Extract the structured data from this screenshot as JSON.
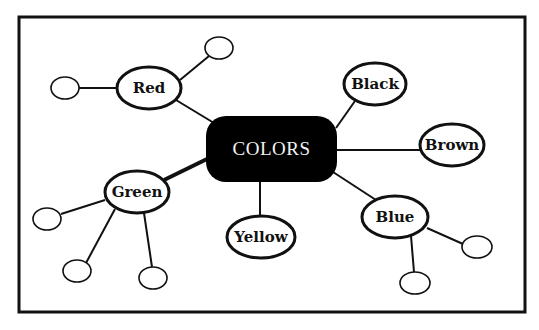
{
  "diagram": {
    "type": "mind-map",
    "center": {
      "label": "COLORS",
      "fill": "#000000",
      "text_color": "#f2f2f2"
    },
    "branches": [
      {
        "label": "Red",
        "empty_children": 2
      },
      {
        "label": "Black",
        "empty_children": 0
      },
      {
        "label": "Brown",
        "empty_children": 0
      },
      {
        "label": "Green",
        "empty_children": 3
      },
      {
        "label": "Yellow",
        "empty_children": 0
      },
      {
        "label": "Blue",
        "empty_children": 2
      }
    ]
  }
}
